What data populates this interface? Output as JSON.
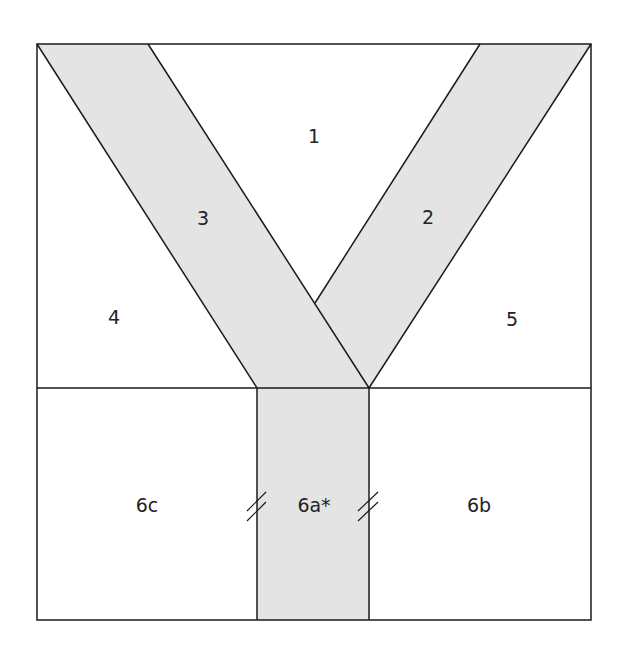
{
  "diagram": {
    "type": "quilt-block-piecing-template",
    "fill_shaded": "#e4e4e4",
    "stroke": "#1a1a1a",
    "pieces": [
      {
        "id": "1",
        "label": "1",
        "shaded": false
      },
      {
        "id": "2",
        "label": "2",
        "shaded": true
      },
      {
        "id": "3",
        "label": "3",
        "shaded": true
      },
      {
        "id": "4",
        "label": "4",
        "shaded": false
      },
      {
        "id": "5",
        "label": "5",
        "shaded": false
      },
      {
        "id": "6a",
        "label": "6a*",
        "shaded": true
      },
      {
        "id": "6b",
        "label": "6b",
        "shaded": false
      },
      {
        "id": "6c",
        "label": "6c",
        "shaded": false
      }
    ],
    "seam_marks": {
      "count": 2,
      "style": "double-slash"
    }
  }
}
